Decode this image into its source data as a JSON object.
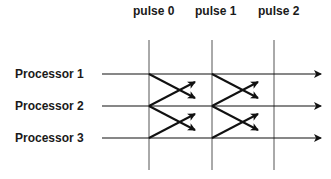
{
  "diagram": {
    "pulses": [
      {
        "label": "pulse 0",
        "x": 149
      },
      {
        "label": "pulse 1",
        "x": 212
      },
      {
        "label": "pulse 2",
        "x": 274
      }
    ],
    "processors": [
      {
        "label": "Processor 1",
        "y": 74
      },
      {
        "label": "Processor 2",
        "y": 106
      },
      {
        "label": "Processor 3",
        "y": 138
      }
    ],
    "messages": [
      {
        "from": "Processor 1",
        "to": "Processor 2",
        "pulse": "pulse 0"
      },
      {
        "from": "Processor 2",
        "to": "Processor 1",
        "pulse": "pulse 0"
      },
      {
        "from": "Processor 2",
        "to": "Processor 3",
        "pulse": "pulse 0"
      },
      {
        "from": "Processor 3",
        "to": "Processor 2",
        "pulse": "pulse 0"
      },
      {
        "from": "Processor 1",
        "to": "Processor 2",
        "pulse": "pulse 1"
      },
      {
        "from": "Processor 2",
        "to": "Processor 1",
        "pulse": "pulse 1"
      },
      {
        "from": "Processor 2",
        "to": "Processor 3",
        "pulse": "pulse 1"
      },
      {
        "from": "Processor 3",
        "to": "Processor 2",
        "pulse": "pulse 1"
      }
    ],
    "colors": {
      "line": "#111111",
      "pulse_line": "#555555"
    }
  }
}
